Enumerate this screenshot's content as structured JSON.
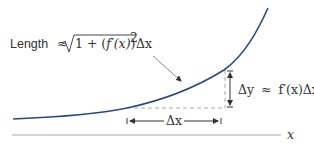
{
  "diagram": {
    "colors": {
      "curve": "#2b4a7a",
      "axis": "#aaaaaa",
      "dashed": "#aaaaaa",
      "arrow": "#333333",
      "leader": "#888888",
      "text": "#333333"
    },
    "labels": {
      "length_word": "Length",
      "approx": "≈",
      "sqrt_one_plus": "1 + (",
      "f_prime": "f′(x)",
      "close_sq": ")",
      "exponent": "2",
      "delta_x_tail": "Δx",
      "delta_y_label": "Δy ≈ f′(x)Δx",
      "delta_y_lhs": "Δy",
      "delta_y_approx": "≈",
      "delta_y_rhs": "f′(x)Δx",
      "delta_x_label": "Δx",
      "axis_label": "x"
    }
  }
}
